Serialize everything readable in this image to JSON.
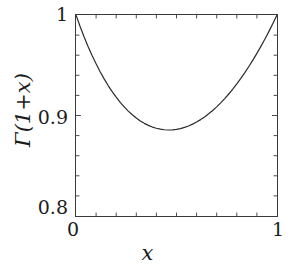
{
  "chart_data": {
    "type": "line",
    "title": "",
    "subtitle": "",
    "xlabel": "x",
    "ylabel": "Γ(1+x)",
    "xlim": [
      0,
      1
    ],
    "ylim": [
      0.8,
      1.0
    ],
    "grid": false,
    "legend": null,
    "x_ticks": [
      {
        "value": 0,
        "label": "0",
        "major": true
      },
      {
        "value": 0.1,
        "label": "",
        "major": false
      },
      {
        "value": 0.2,
        "label": "",
        "major": false
      },
      {
        "value": 0.3,
        "label": "",
        "major": false
      },
      {
        "value": 0.4,
        "label": "",
        "major": false
      },
      {
        "value": 0.5,
        "label": "",
        "major": false
      },
      {
        "value": 0.6,
        "label": "",
        "major": false
      },
      {
        "value": 0.7,
        "label": "",
        "major": false
      },
      {
        "value": 0.8,
        "label": "",
        "major": false
      },
      {
        "value": 0.9,
        "label": "",
        "major": false
      },
      {
        "value": 1.0,
        "label": "1",
        "major": true
      }
    ],
    "y_ticks": [
      {
        "value": 0.8,
        "label": "0.8",
        "major": true
      },
      {
        "value": 0.82,
        "label": "",
        "major": false
      },
      {
        "value": 0.84,
        "label": "",
        "major": false
      },
      {
        "value": 0.86,
        "label": "",
        "major": false
      },
      {
        "value": 0.88,
        "label": "",
        "major": false
      },
      {
        "value": 0.9,
        "label": "0.9",
        "major": true
      },
      {
        "value": 0.92,
        "label": "",
        "major": false
      },
      {
        "value": 0.94,
        "label": "",
        "major": false
      },
      {
        "value": 0.96,
        "label": "",
        "major": false
      },
      {
        "value": 0.98,
        "label": "",
        "major": false
      },
      {
        "value": 1.0,
        "label": "1",
        "major": true
      }
    ],
    "x_tick_labels": [
      "0",
      "1"
    ],
    "y_tick_labels": [
      "0.8",
      "0.9",
      "1"
    ],
    "series": [
      {
        "name": "Γ(1+x)",
        "color": "#2b2b2b",
        "linewidth": 1.2,
        "x": [
          0.0,
          0.02,
          0.04,
          0.06,
          0.08,
          0.1,
          0.12,
          0.14,
          0.16,
          0.18,
          0.2,
          0.22,
          0.24,
          0.26,
          0.28,
          0.3,
          0.32,
          0.34,
          0.36,
          0.38,
          0.4,
          0.42,
          0.44,
          0.4616,
          0.48,
          0.5,
          0.52,
          0.54,
          0.56,
          0.58,
          0.6,
          0.62,
          0.64,
          0.66,
          0.68,
          0.7,
          0.72,
          0.74,
          0.76,
          0.78,
          0.8,
          0.82,
          0.84,
          0.86,
          0.88,
          0.9,
          0.92,
          0.94,
          0.96,
          0.98,
          1.0
        ],
        "y": [
          1.0,
          0.9888,
          0.9784,
          0.9687,
          0.9597,
          0.9514,
          0.9436,
          0.9364,
          0.9298,
          0.9237,
          0.9182,
          0.9131,
          0.9085,
          0.9044,
          0.9007,
          0.8975,
          0.8946,
          0.8922,
          0.8902,
          0.8885,
          0.8873,
          0.8864,
          0.8858,
          0.8856,
          0.8857,
          0.8862,
          0.887,
          0.8882,
          0.8896,
          0.8914,
          0.8935,
          0.8959,
          0.8986,
          0.9017,
          0.905,
          0.9086,
          0.9126,
          0.9168,
          0.9214,
          0.9262,
          0.9314,
          0.9369,
          0.9427,
          0.9488,
          0.9551,
          0.9618,
          0.9688,
          0.9761,
          0.9837,
          0.9917,
          1.0
        ]
      }
    ],
    "annotations": [],
    "minimum": {
      "x": 0.4616,
      "y": 0.8856
    }
  },
  "axes": {
    "y_label": "Γ(1+x)",
    "x_label": "x",
    "y_tick_top": "1",
    "y_tick_mid": "0.9",
    "y_tick_bottom": "0.8",
    "x_tick_left": "0",
    "x_tick_right": "1"
  },
  "style": {
    "background": "#ffffff",
    "frame_color": "#3a3a3a",
    "curve_color": "#2b2b2b",
    "text_color": "#1c1c1c"
  }
}
